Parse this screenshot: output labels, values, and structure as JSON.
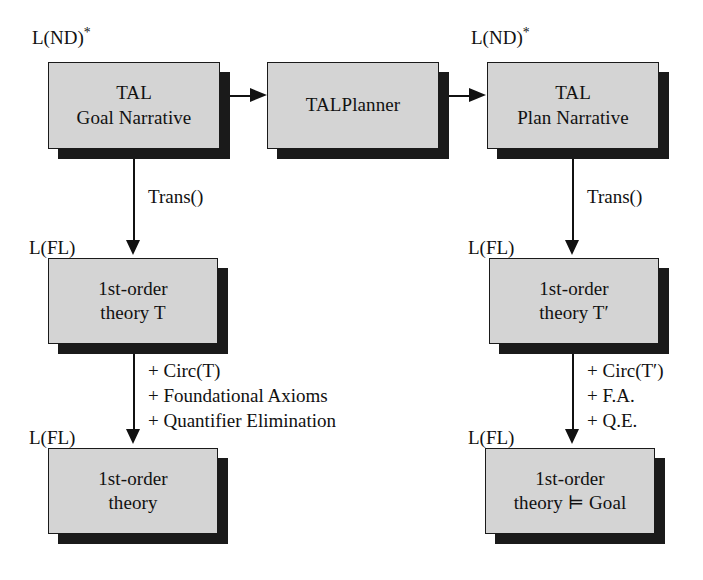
{
  "figure": {
    "type": "flow-diagram",
    "background_color": "#ffffff",
    "box_fill_color": "#d4d4d4",
    "box_border_color": "#1a1a1a",
    "shadow_color": "#1a1a1a",
    "text_color": "#111111"
  },
  "nodes": [
    {
      "id": "tal-goal-narrative",
      "line1": "TAL",
      "line2": "Goal Narrative",
      "language_label": "L(ND)",
      "language_label_sup": "*"
    },
    {
      "id": "talplanner",
      "line1": "TALPlanner",
      "line2": "",
      "language_label": "",
      "language_label_sup": ""
    },
    {
      "id": "tal-plan-narrative",
      "line1": "TAL",
      "line2": "Plan Narrative",
      "language_label": "L(ND)",
      "language_label_sup": "*"
    },
    {
      "id": "first-order-theory-t",
      "line1": "1st-order",
      "line2": "theory T",
      "language_label": "L(FL)",
      "language_label_sup": ""
    },
    {
      "id": "first-order-theory-t-prime",
      "line1": "1st-order",
      "line2": "theory T′",
      "language_label": "L(FL)",
      "language_label_sup": ""
    },
    {
      "id": "first-order-theory",
      "line1": "1st-order",
      "line2": "theory",
      "language_label": "L(FL)",
      "language_label_sup": ""
    },
    {
      "id": "first-order-theory-goal",
      "line1": "1st-order",
      "line2": "theory ⊨ Goal",
      "language_label": "L(FL)",
      "language_label_sup": ""
    }
  ],
  "edge_labels": {
    "trans_left": [
      "Trans()"
    ],
    "trans_right": [
      "Trans()"
    ],
    "circ_left": [
      "+ Circ(T)",
      "+ Foundational Axioms",
      "+ Quantifier Elimination"
    ],
    "circ_right": [
      "+ Circ(T′)",
      "+ F.A.",
      "+ Q.E."
    ]
  }
}
